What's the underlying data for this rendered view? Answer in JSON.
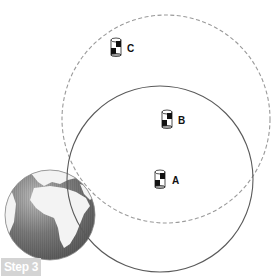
{
  "diagram": {
    "step_label": "Step 3",
    "servers": [
      {
        "id": "C",
        "label": "C"
      },
      {
        "id": "B",
        "label": "B"
      },
      {
        "id": "A",
        "label": "A"
      }
    ],
    "circles": [
      {
        "name": "solid-range-circle",
        "style": "solid",
        "color": "#555555"
      },
      {
        "name": "dashed-range-circle",
        "style": "dashed",
        "color": "#999999"
      }
    ],
    "globe": {
      "color_ocean": "#6e6e6e",
      "color_land": "#f2f2f2"
    }
  }
}
